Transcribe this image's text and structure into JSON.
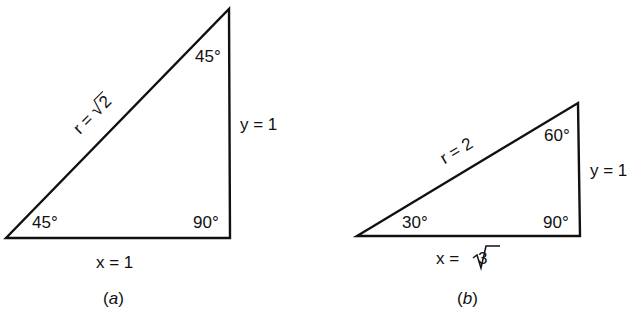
{
  "figure_a": {
    "caption_open": "(",
    "caption_letter": "a",
    "caption_close": ")",
    "hypotenuse_label": "r = ",
    "hypotenuse_radicand": "2",
    "vertical_label": "y = 1",
    "base_label": "x = 1",
    "angle_bottom_left": "45°",
    "angle_top": "45°",
    "angle_right": "90°"
  },
  "figure_b": {
    "caption_open": "(",
    "caption_letter": "b",
    "caption_close": ")",
    "hypotenuse_label": "r = 2",
    "vertical_label": "y = 1",
    "base_label": "x = ",
    "base_radicand": "3",
    "angle_bottom_left": "30°",
    "angle_top": "60°",
    "angle_right": "90°"
  },
  "colors": {
    "stroke": "#111111",
    "background": "#ffffff"
  }
}
